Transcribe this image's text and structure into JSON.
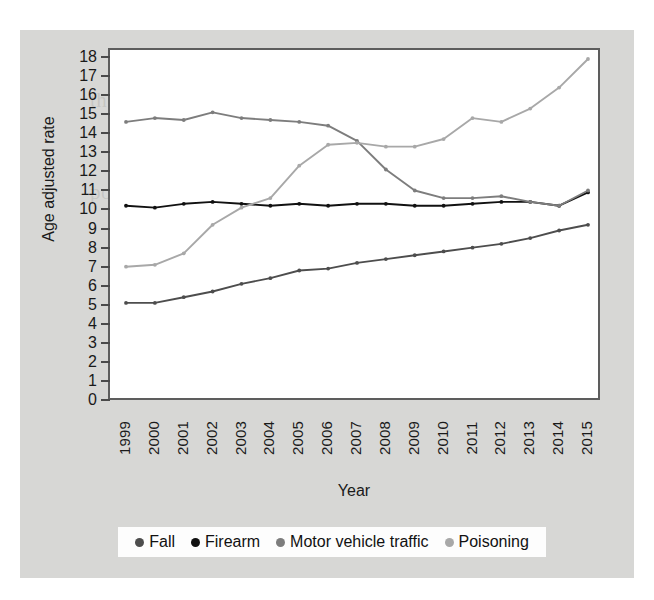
{
  "figure": {
    "background_color": "#d7d7d5",
    "plot_background_color": "#ffffff",
    "frame_color": "#5d5d5d",
    "ghost_text": [
      "the fall from several forms of in",
      "number of the rate of Firearm",
      "poison related rates have risen",
      "while the final about rate rose a"
    ]
  },
  "chart_data": {
    "type": "line",
    "title": "",
    "subtitle": "",
    "xlabel": "Year",
    "ylabel": "Age adjusted rate",
    "x": [
      1999,
      2000,
      2001,
      2002,
      2003,
      2004,
      2005,
      2006,
      2007,
      2008,
      2009,
      2010,
      2011,
      2012,
      2013,
      2014,
      2015
    ],
    "categories": [
      "1999",
      "2000",
      "2001",
      "2002",
      "2003",
      "2004",
      "2005",
      "2006",
      "2007",
      "2008",
      "2009",
      "2010",
      "2011",
      "2012",
      "2013",
      "2014",
      "2015"
    ],
    "xlim": [
      1999,
      2015
    ],
    "ylim": [
      0,
      18
    ],
    "ytick_labels": [
      "18",
      "17",
      "16",
      "15",
      "14",
      "13",
      "12",
      "11",
      "10",
      "9",
      "8",
      "7",
      "6",
      "5",
      "4",
      "3",
      "2",
      "1",
      "0"
    ],
    "ytick_values": [
      18,
      17,
      16,
      15,
      14,
      13,
      12,
      11,
      10,
      9,
      8,
      7,
      6,
      5,
      4,
      3,
      2,
      1,
      0
    ],
    "grid": false,
    "legend_position": "bottom",
    "markers": true,
    "series": [
      {
        "name": "Fall",
        "color": "#4d4d4d",
        "values": [
          5.2,
          5.2,
          5.5,
          5.8,
          6.2,
          6.5,
          6.9,
          7.0,
          7.3,
          7.5,
          7.7,
          7.9,
          8.1,
          8.3,
          8.6,
          9.0,
          9.3
        ]
      },
      {
        "name": "Firearm",
        "color": "#111111",
        "values": [
          10.3,
          10.2,
          10.4,
          10.5,
          10.4,
          10.3,
          10.4,
          10.3,
          10.4,
          10.4,
          10.3,
          10.3,
          10.4,
          10.5,
          10.5,
          10.3,
          11.0
        ]
      },
      {
        "name": "Motor vehicle traffic",
        "color": "#7d7d7d",
        "values": [
          14.7,
          14.9,
          14.8,
          15.2,
          14.9,
          14.8,
          14.7,
          14.5,
          13.7,
          12.2,
          11.1,
          10.7,
          10.7,
          10.8,
          10.5,
          10.3,
          11.1
        ]
      },
      {
        "name": "Poisoning",
        "color": "#a8a8a8",
        "values": [
          7.1,
          7.2,
          7.8,
          9.3,
          10.2,
          10.7,
          12.4,
          13.5,
          13.6,
          13.4,
          13.4,
          13.8,
          14.9,
          14.7,
          15.4,
          16.5,
          18.0
        ]
      }
    ]
  },
  "legend": {
    "items": [
      {
        "label": "Fall",
        "color": "#4d4d4d"
      },
      {
        "label": "Firearm",
        "color": "#111111"
      },
      {
        "label": "Motor vehicle traffic",
        "color": "#7d7d7d"
      },
      {
        "label": "Poisoning",
        "color": "#a8a8a8"
      }
    ]
  }
}
